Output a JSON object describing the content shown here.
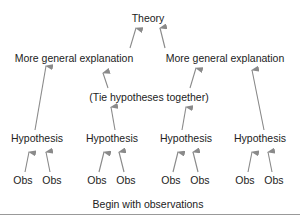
{
  "diagram": {
    "top": {
      "label": "Theory"
    },
    "level2": [
      {
        "label": "More general explanation"
      },
      {
        "label": "More general explanation"
      }
    ],
    "connector": {
      "label": "(Tie hypotheses together)"
    },
    "hypotheses": [
      {
        "label": "Hypothesis"
      },
      {
        "label": "Hypothesis"
      },
      {
        "label": "Hypothesis"
      },
      {
        "label": "Hypothesis"
      }
    ],
    "observations": [
      {
        "label": "Obs"
      },
      {
        "label": "Obs"
      },
      {
        "label": "Obs"
      },
      {
        "label": "Obs"
      },
      {
        "label": "Obs"
      },
      {
        "label": "Obs"
      },
      {
        "label": "Obs"
      },
      {
        "label": "Obs"
      }
    ],
    "caption": "Begin with observations",
    "arrow_color": "#8a8a8a"
  }
}
